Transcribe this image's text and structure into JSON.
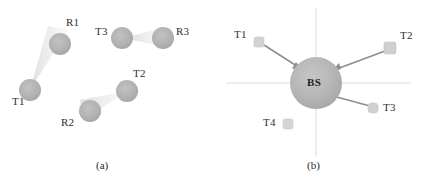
{
  "figure": {
    "background_color": "#ffffff",
    "width": 423,
    "height": 191
  },
  "panel_a": {
    "caption": "(a)",
    "caption_pos": {
      "x": 96,
      "y": 163
    },
    "description": "Three independent transmitter-receiver pairs with directional beam cones",
    "node_radius": 11,
    "node_fill": "#b0b0b0",
    "node_stroke": "#9a9a9a",
    "beam_fill": "#e2e2e2",
    "nodes": [
      {
        "id": "T1",
        "label": "T1",
        "role": "transmitter",
        "x": 30,
        "y": 90,
        "label_x": 12,
        "label_y": 101
      },
      {
        "id": "R1",
        "label": "R1",
        "role": "receiver",
        "x": 60,
        "y": 44,
        "label_x": 66,
        "label_y": 22
      },
      {
        "id": "T3",
        "label": "T3",
        "role": "transmitter",
        "x": 122,
        "y": 38,
        "label_x": 96,
        "label_y": 30
      },
      {
        "id": "R3",
        "label": "R3",
        "role": "receiver",
        "x": 163,
        "y": 38,
        "label_x": 176,
        "label_y": 30
      },
      {
        "id": "R2",
        "label": "R2",
        "role": "receiver",
        "x": 90,
        "y": 111,
        "label_x": 62,
        "label_y": 118
      },
      {
        "id": "T2",
        "label": "T2",
        "role": "transmitter",
        "x": 127,
        "y": 91,
        "label_x": 133,
        "label_y": 74
      }
    ],
    "beams": [
      {
        "from": "T1",
        "to": "R1",
        "spread_deg": 17
      },
      {
        "from": "T3",
        "to": "R3",
        "spread_deg": 17
      },
      {
        "from": "T2",
        "to": "R2",
        "spread_deg": 17
      }
    ]
  },
  "panel_b": {
    "caption": "(b)",
    "caption_pos": {
      "x": 307,
      "y": 163
    },
    "description": "Single base station serving four terminals over directional links",
    "base_station": {
      "id": "BS",
      "label": "BS",
      "x": 316,
      "y": 83,
      "radius": 26,
      "fill": "#b3b3b3",
      "stroke": "#a0a0a0",
      "label_x": 307,
      "label_y": 78
    },
    "axes": {
      "color": "#d8d8d8",
      "horizontal": {
        "x1": 226,
        "y1": 83,
        "x2": 411,
        "y2": 83
      },
      "vertical": {
        "x1": 316,
        "y1": 8,
        "x2": 316,
        "y2": 156
      }
    },
    "terminals": [
      {
        "id": "T1",
        "label": "T1",
        "x": 259,
        "y": 42,
        "size": 10,
        "label_x": 234,
        "label_y": 34,
        "linked": true
      },
      {
        "id": "T2",
        "label": "T2",
        "x": 390,
        "y": 48,
        "size": 11,
        "label_x": 400,
        "label_y": 35,
        "linked": true
      },
      {
        "id": "T3",
        "label": "T3",
        "x": 373,
        "y": 108,
        "size": 10,
        "label_x": 383,
        "label_y": 106,
        "linked": true
      },
      {
        "id": "T4",
        "label": "T4",
        "x": 288,
        "y": 124,
        "size": 10,
        "label_x": 263,
        "label_y": 118,
        "linked": false
      }
    ],
    "terminal_fill": "#d2d2d2",
    "terminal_stroke": "#c2c2c2",
    "link_color": "#8e8e8e",
    "links": [
      {
        "from": "T1",
        "to": "BS",
        "arrow": true
      },
      {
        "from": "T2",
        "to": "BS",
        "arrow": true
      },
      {
        "from": "T3",
        "to": "BS",
        "arrow": false
      }
    ]
  }
}
